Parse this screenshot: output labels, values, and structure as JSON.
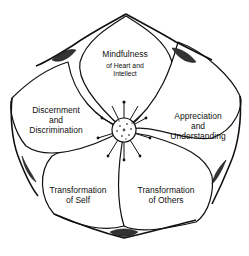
{
  "diagram": {
    "type": "five-petal-flower",
    "center": {
      "name": "flower-center",
      "shape": "spiky-seed-head"
    },
    "colors": {
      "stroke": "#111111",
      "fill": "#ffffff",
      "text": "#111111"
    },
    "petals": [
      {
        "id": "top",
        "main": "Mindfulness",
        "sub_line1": "of Heart and",
        "sub_line2": "Intellect"
      },
      {
        "id": "right",
        "line1": "Appreciation",
        "line2": "and",
        "line3": "Understanding"
      },
      {
        "id": "bottom-right",
        "line1": "Transformation",
        "line2": "of Others"
      },
      {
        "id": "bottom-left",
        "line1": "Transformation",
        "line2": "of Self"
      },
      {
        "id": "left",
        "line1": "Discernment",
        "line2": "and",
        "line3": "Discrimination"
      }
    ]
  }
}
